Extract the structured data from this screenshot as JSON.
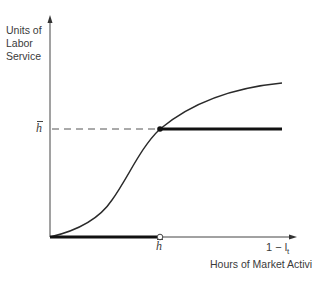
{
  "diagram": {
    "y_axis_label": "Units of Labor Service",
    "x_axis_variable": "1 − l",
    "x_axis_variable_subscript": "t",
    "x_axis_label": "Hours of Market Activity",
    "h_bar_y_tick": "h",
    "h_bar_x_tick": "h",
    "colors": {
      "axis": "#444444",
      "curve": "#2a2a2a",
      "thick_line": "#111111",
      "dashed": "#555555"
    }
  }
}
